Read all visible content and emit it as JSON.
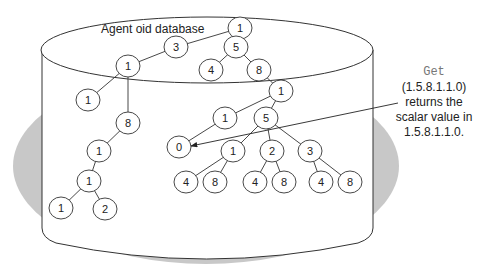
{
  "diagram": {
    "title": "Agent oid database",
    "annotation": {
      "command": "Get",
      "oid_arg": "(1.5.8.1.1.0)",
      "line1": "returns the",
      "line2": "scalar value in",
      "line3": "1.5.8.1.1.0."
    },
    "colors": {
      "shadow": "#c8c8c8",
      "stroke": "#333333",
      "fill": "#ffffff",
      "command_text": "#777777"
    },
    "nodes": [
      {
        "id": "n_root",
        "label": "1",
        "x": 240,
        "y": 28
      },
      {
        "id": "n_3",
        "label": "3",
        "x": 176,
        "y": 47
      },
      {
        "id": "n_5a",
        "label": "5",
        "x": 236,
        "y": 47
      },
      {
        "id": "n_4a",
        "label": "4",
        "x": 211,
        "y": 70
      },
      {
        "id": "n_8a",
        "label": "8",
        "x": 259,
        "y": 70
      },
      {
        "id": "n_1L",
        "label": "1",
        "x": 128,
        "y": 66
      },
      {
        "id": "n_1LL",
        "label": "1",
        "x": 88,
        "y": 100
      },
      {
        "id": "n_8L",
        "label": "8",
        "x": 128,
        "y": 123
      },
      {
        "id": "n_1L2",
        "label": "1",
        "x": 99,
        "y": 151
      },
      {
        "id": "n_1L3",
        "label": "1",
        "x": 89,
        "y": 181
      },
      {
        "id": "n_1L4",
        "label": "1",
        "x": 61,
        "y": 208
      },
      {
        "id": "n_2L4",
        "label": "2",
        "x": 105,
        "y": 209
      },
      {
        "id": "n_1R",
        "label": "1",
        "x": 281,
        "y": 91
      },
      {
        "id": "n_1M",
        "label": "1",
        "x": 225,
        "y": 118
      },
      {
        "id": "n_5M",
        "label": "5",
        "x": 266,
        "y": 118
      },
      {
        "id": "n_0",
        "label": "0",
        "x": 179,
        "y": 147
      },
      {
        "id": "n_1b",
        "label": "1",
        "x": 233,
        "y": 151
      },
      {
        "id": "n_2b",
        "label": "2",
        "x": 272,
        "y": 151
      },
      {
        "id": "n_3b",
        "label": "3",
        "x": 310,
        "y": 151
      },
      {
        "id": "n_4c1",
        "label": "4",
        "x": 186,
        "y": 182
      },
      {
        "id": "n_8c1",
        "label": "8",
        "x": 215,
        "y": 182
      },
      {
        "id": "n_4c2",
        "label": "4",
        "x": 255,
        "y": 182
      },
      {
        "id": "n_8c2",
        "label": "8",
        "x": 284,
        "y": 182
      },
      {
        "id": "n_4c3",
        "label": "4",
        "x": 321,
        "y": 182
      },
      {
        "id": "n_8c3",
        "label": "8",
        "x": 350,
        "y": 182
      }
    ],
    "edges": [
      [
        "n_root",
        "n_3"
      ],
      [
        "n_root",
        "n_5a"
      ],
      [
        "n_3",
        "n_1L"
      ],
      [
        "n_5a",
        "n_4a"
      ],
      [
        "n_5a",
        "n_8a"
      ],
      [
        "n_1L",
        "n_1LL"
      ],
      [
        "n_1L",
        "n_8L"
      ],
      [
        "n_8L",
        "n_1L2"
      ],
      [
        "n_1L2",
        "n_1L3"
      ],
      [
        "n_1L3",
        "n_1L4"
      ],
      [
        "n_1L3",
        "n_2L4"
      ],
      [
        "n_8a",
        "n_1R"
      ],
      [
        "n_1R",
        "n_1M"
      ],
      [
        "n_1R",
        "n_5M"
      ],
      [
        "n_1M",
        "n_0"
      ],
      [
        "n_5M",
        "n_1b"
      ],
      [
        "n_5M",
        "n_2b"
      ],
      [
        "n_5M",
        "n_3b"
      ],
      [
        "n_1b",
        "n_4c1"
      ],
      [
        "n_1b",
        "n_8c1"
      ],
      [
        "n_2b",
        "n_4c2"
      ],
      [
        "n_2b",
        "n_8c2"
      ],
      [
        "n_3b",
        "n_4c3"
      ],
      [
        "n_3b",
        "n_8c3"
      ]
    ],
    "pointer": {
      "from": {
        "x": 398,
        "y": 103
      },
      "to": {
        "x": 191,
        "y": 146
      },
      "target": "n_0"
    }
  }
}
